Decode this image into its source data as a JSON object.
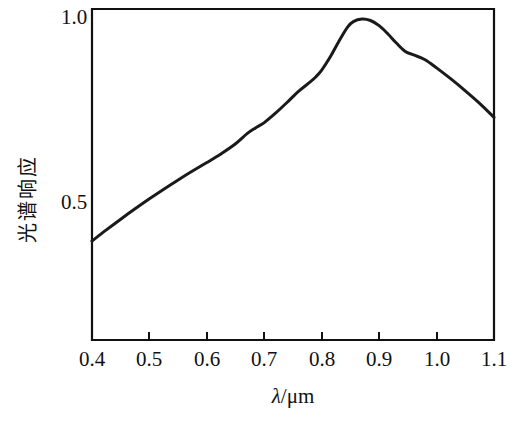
{
  "chart_data": {
    "type": "line",
    "title": "",
    "xlabel": "λ/μm",
    "ylabel": "光谱响应",
    "xlim": [
      0.4,
      1.1
    ],
    "ylim": [
      0.36,
      1.02
    ],
    "grid": false,
    "legend": false,
    "xticks": [
      "0.4",
      "0.5",
      "0.6",
      "0.7",
      "0.8",
      "0.9",
      "1.0",
      "1.1"
    ],
    "xtick_values": [
      0.4,
      0.5,
      0.6,
      0.7,
      0.8,
      0.9,
      1.0,
      1.1
    ],
    "yticks": [
      "0.5",
      "1.0"
    ],
    "ytick_values": [
      0.5,
      1.0
    ],
    "series": [
      {
        "name": "光谱响应",
        "color": "#1a1a1a",
        "x": [
          0.4,
          0.425,
          0.45,
          0.475,
          0.5,
          0.525,
          0.55,
          0.575,
          0.6,
          0.625,
          0.65,
          0.67,
          0.684,
          0.7,
          0.72,
          0.74,
          0.76,
          0.78,
          0.79,
          0.8,
          0.815,
          0.83,
          0.845,
          0.855,
          0.87,
          0.885,
          0.9,
          0.915,
          0.93,
          0.945,
          0.96,
          0.98,
          1.0,
          1.025,
          1.05,
          1.075,
          1.1
        ],
        "y": [
          0.4,
          0.43,
          0.459,
          0.487,
          0.514,
          0.54,
          0.565,
          0.589,
          0.612,
          0.636,
          0.663,
          0.69,
          0.705,
          0.72,
          0.746,
          0.775,
          0.805,
          0.83,
          0.844,
          0.862,
          0.898,
          0.94,
          0.978,
          0.993,
          1.0,
          0.996,
          0.982,
          0.96,
          0.935,
          0.913,
          0.903,
          0.89,
          0.868,
          0.838,
          0.806,
          0.772,
          0.734
        ]
      }
    ],
    "annotations": {
      "peak_x": 0.87,
      "peak_y": 1.0,
      "shoulder1_x": 0.684,
      "shoulder2_x": 0.945,
      "start_value": 0.4,
      "end_value": 0.734
    }
  },
  "axes": {
    "y_axis_label": "光谱响应",
    "y_axis_chars": [
      "光",
      "谱",
      "响",
      "应"
    ],
    "x_axis_label_symbol": "λ",
    "x_axis_label_unit": "/μm"
  },
  "colors": {
    "curve": "#1a1a1a",
    "frame": "#111111",
    "background": "#ffffff",
    "text": "#111111"
  }
}
